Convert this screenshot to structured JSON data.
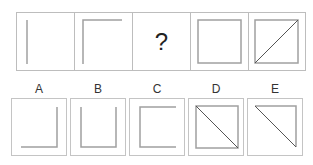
{
  "puzzle": {
    "sequence": [
      {
        "position": 1,
        "figure": "left-vertical-line"
      },
      {
        "position": 2,
        "figure": "left-and-top-lines"
      },
      {
        "position": 3,
        "figure": "question-mark",
        "text": "?"
      },
      {
        "position": 4,
        "figure": "full-square"
      },
      {
        "position": 5,
        "figure": "square-with-diagonal-bottomleft-to-topright"
      }
    ],
    "options": [
      {
        "label": "A",
        "figure": "right-and-bottom-lines"
      },
      {
        "label": "B",
        "figure": "left-bottom-right-lines"
      },
      {
        "label": "C",
        "figure": "top-left-bottom-lines"
      },
      {
        "label": "D",
        "figure": "square-with-diagonal-topleft-to-bottomright"
      },
      {
        "label": "E",
        "figure": "top-right-lines-with-diagonal"
      }
    ],
    "colors": {
      "border": "#bdbdbd",
      "line": "#9a9a9a",
      "diagonal": "#555555"
    }
  }
}
